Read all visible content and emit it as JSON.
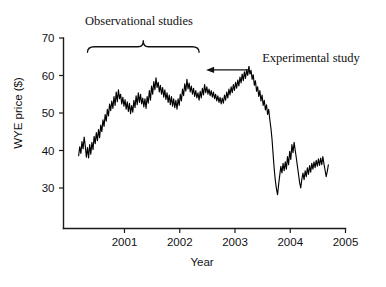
{
  "chart_data": {
    "type": "line",
    "title": "",
    "xlabel": "Year",
    "ylabel": "WYE price ($)",
    "xlim": [
      2000.15,
      2005.0
    ],
    "ylim": [
      25.0,
      70.0
    ],
    "grid": false,
    "legend": null,
    "x_ticks": [
      "2001",
      "2002",
      "2003",
      "2004",
      "2005"
    ],
    "x_tick_values": [
      2001,
      2002,
      2003,
      2004,
      2005
    ],
    "y_ticks": [
      "30",
      "40",
      "50",
      "60",
      "70"
    ],
    "y_tick_values": [
      30,
      40,
      50,
      60,
      70
    ],
    "series": [
      {
        "name": "WYE price",
        "color": "#000000",
        "x": [
          2000.17,
          2000.19,
          2000.21,
          2000.23,
          2000.25,
          2000.27,
          2000.29,
          2000.31,
          2000.33,
          2000.35,
          2000.37,
          2000.39,
          2000.41,
          2000.43,
          2000.45,
          2000.47,
          2000.49,
          2000.51,
          2000.53,
          2000.55,
          2000.57,
          2000.59,
          2000.61,
          2000.63,
          2000.65,
          2000.67,
          2000.69,
          2000.71,
          2000.73,
          2000.75,
          2000.77,
          2000.79,
          2000.81,
          2000.83,
          2000.85,
          2000.87,
          2000.89,
          2000.91,
          2000.93,
          2000.95,
          2000.97,
          2000.99,
          2001.01,
          2001.03,
          2001.05,
          2001.07,
          2001.09,
          2001.11,
          2001.13,
          2001.15,
          2001.17,
          2001.19,
          2001.21,
          2001.23,
          2001.25,
          2001.27,
          2001.29,
          2001.31,
          2001.33,
          2001.35,
          2001.37,
          2001.39,
          2001.41,
          2001.43,
          2001.45,
          2001.47,
          2001.49,
          2001.51,
          2001.53,
          2001.55,
          2001.57,
          2001.59,
          2001.61,
          2001.63,
          2001.65,
          2001.67,
          2001.69,
          2001.71,
          2001.73,
          2001.75,
          2001.77,
          2001.79,
          2001.81,
          2001.83,
          2001.85,
          2001.87,
          2001.89,
          2001.91,
          2001.93,
          2001.95,
          2001.97,
          2001.99,
          2002.01,
          2002.03,
          2002.05,
          2002.07,
          2002.09,
          2002.11,
          2002.13,
          2002.15,
          2002.17,
          2002.19,
          2002.21,
          2002.23,
          2002.25,
          2002.27,
          2002.29,
          2002.31,
          2002.33,
          2002.35,
          2002.37,
          2002.39,
          2002.41,
          2002.43,
          2002.45,
          2002.47,
          2002.49,
          2002.51,
          2002.53,
          2002.55,
          2002.57,
          2002.59,
          2002.61,
          2002.63,
          2002.65,
          2002.67,
          2002.69,
          2002.71,
          2002.73,
          2002.75,
          2002.77,
          2002.79,
          2002.81,
          2002.83,
          2002.85,
          2002.87,
          2002.89,
          2002.91,
          2002.93,
          2002.95,
          2002.97,
          2002.99,
          2003.01,
          2003.03,
          2003.05,
          2003.07,
          2003.09,
          2003.11,
          2003.13,
          2003.15,
          2003.17,
          2003.19,
          2003.21,
          2003.23,
          2003.25,
          2003.27,
          2003.29,
          2003.31,
          2003.33,
          2003.35,
          2003.37,
          2003.39,
          2003.41,
          2003.43,
          2003.45,
          2003.47,
          2003.49,
          2003.51,
          2003.53,
          2003.55,
          2003.57,
          2003.59,
          2003.61,
          2003.63,
          2003.65,
          2003.67,
          2003.69,
          2003.71,
          2003.73,
          2003.75,
          2003.77,
          2003.79,
          2003.81,
          2003.83,
          2003.85,
          2003.87,
          2003.89,
          2003.91,
          2003.93,
          2003.95,
          2003.97,
          2003.99,
          2004.01,
          2004.03,
          2004.05,
          2004.07,
          2004.09,
          2004.11,
          2004.13,
          2004.15,
          2004.17,
          2004.19,
          2004.21,
          2004.23,
          2004.25,
          2004.27,
          2004.29,
          2004.31,
          2004.33,
          2004.35,
          2004.37,
          2004.39,
          2004.41,
          2004.43,
          2004.45,
          2004.47,
          2004.49,
          2004.51,
          2004.53,
          2004.55,
          2004.57,
          2004.59,
          2004.61,
          2004.63,
          2004.65,
          2004.67,
          2004.69
        ],
        "y": [
          38.6,
          41.0,
          39.2,
          42.4,
          40.4,
          43.6,
          41.2,
          38.2,
          40.8,
          38.0,
          41.6,
          39.0,
          42.2,
          40.2,
          43.8,
          41.8,
          44.8,
          42.6,
          45.6,
          43.4,
          46.8,
          45.0,
          48.2,
          46.4,
          49.6,
          47.8,
          51.0,
          49.2,
          52.4,
          50.6,
          53.2,
          51.2,
          54.4,
          52.0,
          55.6,
          53.0,
          56.2,
          53.8,
          55.0,
          52.4,
          54.2,
          51.8,
          53.6,
          51.0,
          53.0,
          50.4,
          52.6,
          49.8,
          52.0,
          50.2,
          53.4,
          51.4,
          54.6,
          52.2,
          55.4,
          52.8,
          55.0,
          52.4,
          54.0,
          51.6,
          53.8,
          51.2,
          54.4,
          52.6,
          56.0,
          53.4,
          57.2,
          55.0,
          58.4,
          56.2,
          59.4,
          56.8,
          58.2,
          55.6,
          57.4,
          55.0,
          56.8,
          54.2,
          56.2,
          53.6,
          55.4,
          52.8,
          54.8,
          52.2,
          54.4,
          51.8,
          53.8,
          51.4,
          53.4,
          51.0,
          53.8,
          52.0,
          55.0,
          53.2,
          56.4,
          54.6,
          57.8,
          55.8,
          59.0,
          56.4,
          58.0,
          55.6,
          57.2,
          55.0,
          56.6,
          54.4,
          56.0,
          54.0,
          55.4,
          53.4,
          55.8,
          54.0,
          56.6,
          54.8,
          57.6,
          55.4,
          57.0,
          55.0,
          56.4,
          54.6,
          56.0,
          54.2,
          55.6,
          53.8,
          55.0,
          53.2,
          54.6,
          52.8,
          54.2,
          52.4,
          54.0,
          52.6,
          54.8,
          53.4,
          55.6,
          54.0,
          56.4,
          54.8,
          57.0,
          55.4,
          57.6,
          56.0,
          58.2,
          56.6,
          58.8,
          57.2,
          59.6,
          58.0,
          60.4,
          58.6,
          61.0,
          59.2,
          61.6,
          60.0,
          62.2,
          60.4,
          61.4,
          59.0,
          60.2,
          57.4,
          58.6,
          55.8,
          57.0,
          54.4,
          56.0,
          53.2,
          54.8,
          52.0,
          53.4,
          50.8,
          52.2,
          49.6,
          51.0,
          48.2,
          46.0,
          43.0,
          39.0,
          35.0,
          32.0,
          29.8,
          28.2,
          31.0,
          33.4,
          35.8,
          34.0,
          36.6,
          34.6,
          37.0,
          35.0,
          38.4,
          36.2,
          39.8,
          37.6,
          41.6,
          39.4,
          42.2,
          40.0,
          38.0,
          35.8,
          33.6,
          31.4,
          30.0,
          32.4,
          34.0,
          32.2,
          34.6,
          33.0,
          35.4,
          33.6,
          36.0,
          34.2,
          36.6,
          35.0,
          37.0,
          35.4,
          37.4,
          35.8,
          37.8,
          36.0,
          38.0,
          36.2,
          38.4,
          36.4,
          34.8,
          33.0,
          34.4,
          36.2
        ]
      }
    ],
    "annotations": [
      {
        "name": "observational-studies",
        "text": "Observational studies",
        "type": "brace",
        "x_start": 2000.33,
        "x_end": 2002.35,
        "y": 69.0
      },
      {
        "name": "experimental-study",
        "text": "Experimental study",
        "type": "arrow",
        "target_x": 2002.45,
        "target_y": 61.5
      }
    ]
  }
}
